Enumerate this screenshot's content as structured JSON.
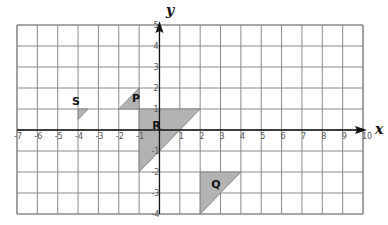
{
  "chart_data": {
    "type": "coordinate_grid",
    "title": "",
    "xlabel": "x",
    "ylabel": "y",
    "xlim": [
      -7,
      10
    ],
    "ylim": [
      -4,
      5
    ],
    "grid": true,
    "x_ticks": [
      "-7",
      "-6",
      "-5",
      "-4",
      "-3",
      "-2",
      "-1",
      "1",
      "2",
      "3",
      "4",
      "5",
      "6",
      "7",
      "8",
      "9",
      "10"
    ],
    "y_ticks": [
      "5",
      "4",
      "3",
      "2",
      "1",
      "-1",
      "-2",
      "-3",
      "-4"
    ],
    "shapes": [
      {
        "name": "S",
        "vertices": [
          [
            -4,
            1
          ],
          [
            -3.5,
            1
          ],
          [
            -4,
            0.5
          ]
        ],
        "label_pos": [
          -4.3,
          1.2
        ]
      },
      {
        "name": "P",
        "vertices": [
          [
            -2,
            1
          ],
          [
            -1,
            1
          ],
          [
            -1,
            2
          ]
        ],
        "label_pos": [
          -1.35,
          1.35
        ]
      },
      {
        "name": "R",
        "vertices": [
          [
            -1,
            1
          ],
          [
            2,
            1
          ],
          [
            -1,
            -2
          ]
        ],
        "label_pos": [
          -0.35,
          0.05
        ]
      },
      {
        "name": "Q",
        "vertices": [
          [
            2,
            -2
          ],
          [
            4,
            -2
          ],
          [
            2,
            -4
          ]
        ],
        "label_pos": [
          2.55,
          -2.75
        ]
      }
    ],
    "fill_color": "#b3b3b3",
    "grid_color": "#8a8a8a",
    "axis_color": "#111111"
  },
  "labels": {
    "x_axis": "x",
    "y_axis": "y",
    "shape_S": "S",
    "shape_P": "P",
    "shape_R": "R",
    "shape_Q": "Q"
  }
}
